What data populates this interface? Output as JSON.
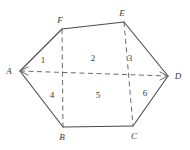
{
  "figure": {
    "kind": "geometry-diagram",
    "canvas": {
      "width": 190,
      "height": 150
    },
    "colors": {
      "background": "#ffffff",
      "solid_stroke": "#4a4a4a",
      "dashed_stroke": "#6b6b6b",
      "label_text": "#3a3a3a"
    },
    "vertices": [
      {
        "name": "A",
        "label": "A",
        "x": 20,
        "y": 71,
        "label_x": 9,
        "label_y": 71
      },
      {
        "name": "B",
        "label": "B",
        "x": 63,
        "y": 127,
        "label_x": 62,
        "label_y": 137
      },
      {
        "name": "C",
        "label": "C",
        "x": 133,
        "y": 126,
        "label_x": 134,
        "label_y": 136
      },
      {
        "name": "D",
        "label": "D",
        "x": 168,
        "y": 76,
        "label_x": 178,
        "label_y": 76
      },
      {
        "name": "E",
        "label": "E",
        "x": 124,
        "y": 22,
        "label_x": 122,
        "label_y": 13
      },
      {
        "name": "F",
        "label": "F",
        "x": 62,
        "y": 29,
        "label_x": 60,
        "label_y": 20
      }
    ],
    "solid_edges": [
      {
        "name": "edge-A-F",
        "from": "A",
        "to": "F"
      },
      {
        "name": "edge-F-E",
        "from": "F",
        "to": "E"
      },
      {
        "name": "edge-E-D",
        "from": "E",
        "to": "D"
      },
      {
        "name": "edge-A-B",
        "from": "A",
        "to": "B"
      },
      {
        "name": "edge-B-C",
        "from": "B",
        "to": "C"
      },
      {
        "name": "edge-C-D",
        "from": "C",
        "to": "D"
      }
    ],
    "dashed_edges": [
      {
        "name": "dashed-A-D",
        "x1": 20,
        "y1": 71,
        "x2": 168,
        "y2": 76
      },
      {
        "name": "dashed-F-B",
        "x1": 62,
        "y1": 29,
        "x2": 63,
        "y2": 127
      },
      {
        "name": "dashed-E-C",
        "x1": 124,
        "y1": 22,
        "x2": 133,
        "y2": 126
      }
    ],
    "arrowheads": [
      {
        "name": "arrowhead-at-A",
        "at": "A"
      },
      {
        "name": "arrowhead-at-D",
        "at": "D"
      }
    ],
    "regions": [
      {
        "name": "region-1",
        "label": "1",
        "x": 43,
        "y": 60
      },
      {
        "name": "region-2",
        "label": "2",
        "x": 93,
        "y": 58
      },
      {
        "name": "region-3",
        "label": "3",
        "x": 130,
        "y": 58
      },
      {
        "name": "region-4",
        "label": "4",
        "x": 52,
        "y": 95
      },
      {
        "name": "region-5",
        "label": "5",
        "x": 98,
        "y": 95
      },
      {
        "name": "region-6",
        "label": "6",
        "x": 145,
        "y": 93
      }
    ]
  }
}
